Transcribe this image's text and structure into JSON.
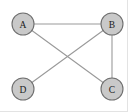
{
  "figure": {
    "background_color": "#ffffff",
    "border_color": "#e3e3e3"
  },
  "chart_data": {
    "type": "diagram",
    "diagram_kind": "undirected-graph",
    "title": "",
    "node_count": 4,
    "edge_count": 4,
    "node_fill": "#c9c9c9",
    "node_stroke": "#6f6f6f",
    "edge_color": "#9a9a9a",
    "node_radius": 11,
    "nodes": [
      {
        "id": "A",
        "label": "A",
        "x": 23,
        "y": 24
      },
      {
        "id": "B",
        "label": "B",
        "x": 112,
        "y": 24
      },
      {
        "id": "C",
        "label": "C",
        "x": 112,
        "y": 89
      },
      {
        "id": "D",
        "label": "D",
        "x": 23,
        "y": 89
      }
    ],
    "edges": [
      {
        "from": "A",
        "to": "B"
      },
      {
        "from": "A",
        "to": "C"
      },
      {
        "from": "B",
        "to": "C"
      },
      {
        "from": "B",
        "to": "D"
      }
    ],
    "adjacency": {
      "A": [
        "B",
        "C"
      ],
      "B": [
        "A",
        "C",
        "D"
      ],
      "C": [
        "A",
        "B"
      ],
      "D": [
        "B"
      ]
    },
    "degrees": {
      "A": 2,
      "B": 3,
      "C": 2,
      "D": 1
    },
    "xlim": [
      0,
      128
    ],
    "ylim": [
      0,
      112
    ],
    "grid": false,
    "legend": false
  }
}
